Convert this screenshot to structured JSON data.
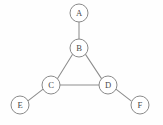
{
  "figure": {
    "name": "undirected-graph",
    "background_color": "#fefefe",
    "width": 163,
    "height": 125
  },
  "style": {
    "node_fill": "#ffffff",
    "node_stroke": "#8a8a8a",
    "node_radius": 9,
    "edge_color": "#8d8d8d",
    "edge_width": 1.05,
    "label_color": "#4a4a4a",
    "label_font_size": 8.6
  },
  "graph_data": {
    "type": "graph",
    "directed": false,
    "node_count": 6,
    "edge_count": 6,
    "nodes": [
      {
        "id": "A",
        "label": "A",
        "x": 79,
        "y": 13,
        "r": 9,
        "degree": 1
      },
      {
        "id": "B",
        "label": "B",
        "x": 79,
        "y": 48,
        "r": 9,
        "degree": 3
      },
      {
        "id": "C",
        "label": "C",
        "x": 51,
        "y": 85,
        "r": 9,
        "degree": 3
      },
      {
        "id": "D",
        "label": "D",
        "x": 108,
        "y": 85,
        "r": 9,
        "degree": 3
      },
      {
        "id": "E",
        "label": "E",
        "x": 20,
        "y": 105,
        "r": 9,
        "degree": 1
      },
      {
        "id": "F",
        "label": "F",
        "x": 140,
        "y": 105,
        "r": 9,
        "degree": 1
      }
    ],
    "edges": [
      {
        "id": "A-B",
        "source": "A",
        "target": "B",
        "x1": 79,
        "y1": 22,
        "x2": 79,
        "y2": 39
      },
      {
        "id": "B-C",
        "source": "B",
        "target": "C",
        "x1": 72.6,
        "y1": 54.3,
        "x2": 57.4,
        "y2": 78.7
      },
      {
        "id": "B-D",
        "source": "B",
        "target": "D",
        "x1": 85.5,
        "y1": 54.4,
        "x2": 101.5,
        "y2": 78.6
      },
      {
        "id": "C-D",
        "source": "C",
        "target": "D",
        "x1": 60,
        "y1": 85,
        "x2": 99,
        "y2": 85
      },
      {
        "id": "C-E",
        "source": "C",
        "target": "E",
        "x1": 43.1,
        "y1": 89.2,
        "x2": 27.9,
        "y2": 100.8
      },
      {
        "id": "D-F",
        "source": "D",
        "target": "F",
        "x1": 115.9,
        "y1": 89.2,
        "x2": 131.1,
        "y2": 100.8
      }
    ]
  }
}
